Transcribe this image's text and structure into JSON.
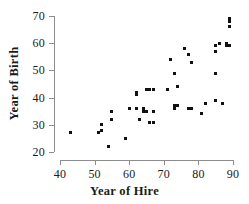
{
  "chart_data": {
    "type": "scatter",
    "title": "",
    "xlabel": "Year of Hire",
    "ylabel": "Year of Birth",
    "xlim": [
      40,
      90
    ],
    "ylim": [
      20,
      70
    ],
    "xticks": [
      40,
      50,
      60,
      70,
      80,
      90
    ],
    "yticks": [
      20,
      30,
      40,
      50,
      60,
      70
    ],
    "grid": false,
    "legend": null,
    "marker": "square",
    "marker_color": "#111111",
    "points": [
      [
        43,
        27
      ],
      [
        51,
        27
      ],
      [
        52,
        30
      ],
      [
        52,
        28
      ],
      [
        54,
        22
      ],
      [
        55,
        35
      ],
      [
        55,
        32
      ],
      [
        59,
        25
      ],
      [
        60,
        36
      ],
      [
        62,
        42
      ],
      [
        62,
        41
      ],
      [
        62,
        36
      ],
      [
        63,
        32
      ],
      [
        64,
        36
      ],
      [
        64,
        35
      ],
      [
        65,
        43
      ],
      [
        65,
        35
      ],
      [
        66,
        31
      ],
      [
        66,
        43
      ],
      [
        67,
        43
      ],
      [
        67,
        31
      ],
      [
        67,
        35
      ],
      [
        71,
        43
      ],
      [
        72,
        54
      ],
      [
        73,
        49
      ],
      [
        73,
        37
      ],
      [
        73,
        36
      ],
      [
        74,
        44
      ],
      [
        74,
        37
      ],
      [
        76,
        58
      ],
      [
        77,
        56
      ],
      [
        77,
        36
      ],
      [
        78,
        53
      ],
      [
        78,
        36
      ],
      [
        81,
        34
      ],
      [
        82,
        38
      ],
      [
        85,
        59
      ],
      [
        85,
        57
      ],
      [
        85,
        49
      ],
      [
        85,
        39
      ],
      [
        86,
        60
      ],
      [
        87,
        38
      ],
      [
        88,
        60
      ],
      [
        88,
        59
      ],
      [
        89,
        68
      ],
      [
        89,
        69
      ],
      [
        89,
        66
      ],
      [
        89,
        59
      ]
    ]
  }
}
